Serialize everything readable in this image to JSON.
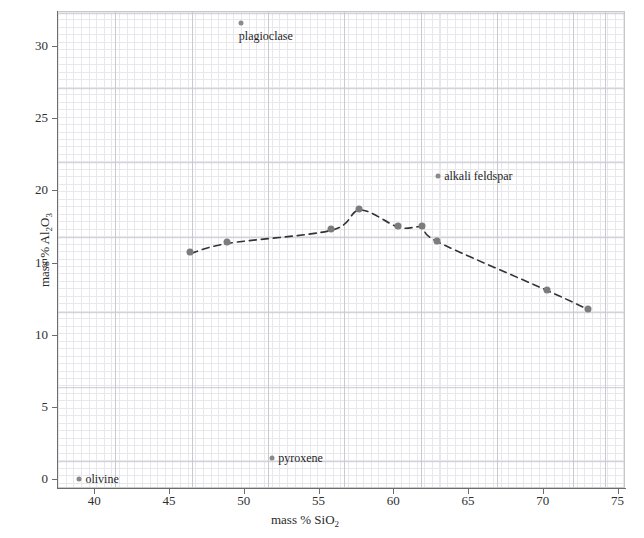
{
  "chart_data": {
    "type": "scatter",
    "title": "",
    "xlabel": "mass % SiO2",
    "xlabel_html": "mass % SiO<sub>2</sub>",
    "ylabel": "mass % Al2O3",
    "ylabel_html": "mass % Al<sub>2</sub>O<sub>3</sub>",
    "xlim": [
      37.5,
      75.5
    ],
    "ylim": [
      -0.6,
      32.4
    ],
    "xticks": [
      40,
      45,
      50,
      55,
      60,
      65,
      70,
      75
    ],
    "yticks": [
      0,
      5,
      10,
      15,
      20,
      25,
      30
    ],
    "grid": true,
    "grid_style": "graph-paper, minor every 0.5 unit, major every 5 units",
    "legend": "none",
    "marker_color": "#7c7c7c",
    "trend_color": "#333333",
    "trend_style": "dashed",
    "series": [
      {
        "name": "rock series trend",
        "points": [
          {
            "x": 46.4,
            "y": 15.7
          },
          {
            "x": 48.9,
            "y": 16.4
          },
          {
            "x": 55.8,
            "y": 17.3
          },
          {
            "x": 57.7,
            "y": 18.7
          },
          {
            "x": 60.3,
            "y": 17.5
          },
          {
            "x": 61.9,
            "y": 17.5
          },
          {
            "x": 62.9,
            "y": 16.5
          },
          {
            "x": 70.3,
            "y": 13.1
          },
          {
            "x": 73.0,
            "y": 11.8
          }
        ]
      },
      {
        "name": "labeled minerals",
        "points": [
          {
            "x": 39.0,
            "y": 0.05,
            "label": "olivine"
          },
          {
            "x": 51.9,
            "y": 1.5,
            "label": "pyroxene"
          },
          {
            "x": 49.8,
            "y": 31.6,
            "label": "plagioclase"
          },
          {
            "x": 63.0,
            "y": 21.0,
            "label": "alkali feldspar"
          }
        ]
      }
    ],
    "annotations": [
      {
        "text": "olivine",
        "x": 39.0,
        "y": 0.05
      },
      {
        "text": "pyroxene",
        "x": 51.9,
        "y": 1.5
      },
      {
        "text": "plagioclase",
        "x": 49.8,
        "y": 31.6
      },
      {
        "text": "alkali feldspar",
        "x": 63.0,
        "y": 21.0
      }
    ]
  }
}
